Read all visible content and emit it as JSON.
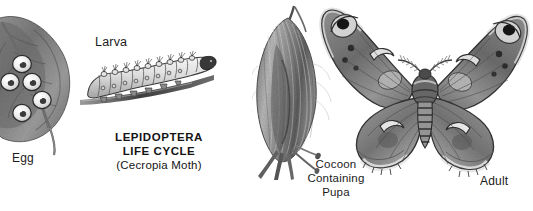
{
  "page": {
    "background_color": "#ffffff",
    "ink_color": "#1b1b1b",
    "style": "grayscale scientific illustration plate"
  },
  "title": {
    "line1": "LEPIDOPTERA",
    "line2": "LIFE  CYCLE",
    "line3": "(Cecropia Moth)"
  },
  "labels": {
    "egg": "Egg",
    "larva": "Larva",
    "cocoon_line1": "Cocoon",
    "cocoon_line2": "Containing",
    "cocoon_line3": "Pupa",
    "adult": "Adult"
  },
  "figures": [
    {
      "name": "egg-on-leaf-illustration",
      "stage": "Egg",
      "description": "Leaf with five white disc-shaped eggs attached to its surface",
      "egg_count": 5
    },
    {
      "name": "larva-illustration",
      "stage": "Larva",
      "description": "Segmented caterpillar with tubercles resting on a twig",
      "segment_count": 11
    },
    {
      "name": "cocoon-illustration",
      "stage": "Cocoon Containing Pupa",
      "description": "Spindle-shaped silken cocoon spun onto a twig"
    },
    {
      "name": "adult-moth-illustration",
      "stage": "Adult",
      "description": "Cecropia moth with four wings, crescent spots, forewing eyespots, striped abdomen and feathery antennae",
      "wing_count": 4,
      "eyespot_count": 2
    }
  ]
}
